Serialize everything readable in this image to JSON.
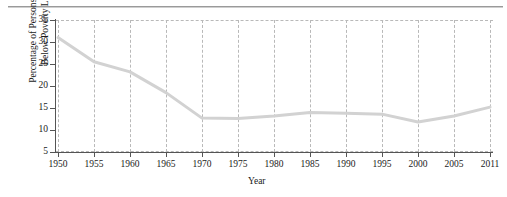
{
  "chart_data": {
    "type": "line",
    "title": "",
    "xlabel": "Year",
    "ylabel_line1": "Percentage of Persons Living",
    "ylabel_line2": "Below Poverty Line",
    "x": [
      1950,
      1955,
      1960,
      1965,
      1970,
      1975,
      1980,
      1985,
      1990,
      1995,
      2000,
      2005,
      2011
    ],
    "values": [
      31.0,
      25.5,
      23.2,
      18.5,
      12.7,
      12.6,
      13.2,
      14.0,
      13.8,
      13.6,
      11.8,
      13.2,
      15.2
    ],
    "series": [
      {
        "name": "Percentage of Persons Living Below Poverty Line",
        "values": [
          31.0,
          25.5,
          23.2,
          18.5,
          12.7,
          12.6,
          13.2,
          14.0,
          13.8,
          13.6,
          11.8,
          13.2,
          15.2
        ]
      }
    ],
    "xtick_labels": [
      "1950",
      "1955",
      "1960",
      "1965",
      "1970",
      "1975",
      "1980",
      "1985",
      "1990",
      "1995",
      "2000",
      "2005",
      "2011"
    ],
    "ytick_labels": [
      "5",
      "10",
      "15",
      "20",
      "25",
      "30",
      "35"
    ],
    "ytick_values": [
      5,
      10,
      15,
      20,
      25,
      30,
      35
    ],
    "ylim": [
      5,
      35
    ],
    "xlim": [
      1950,
      2011
    ],
    "grid": "dashed-vertical-and-horizontal-bounds",
    "legend": "none",
    "line_color": "#d2d2d2",
    "line_width": 3,
    "axis_color": "#555555",
    "grid_color": "#b9b9b9"
  }
}
